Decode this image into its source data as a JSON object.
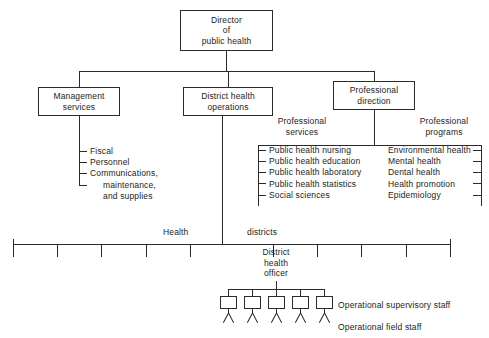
{
  "nodes": {
    "director": {
      "line1": "Director",
      "line2": "of",
      "line3": "public health"
    },
    "management": {
      "line1": "Management",
      "line2": "services"
    },
    "district_ops": {
      "line1": "District health",
      "line2": "operations"
    },
    "prof_direction": {
      "line1": "Professional",
      "line2": "direction"
    }
  },
  "headings": {
    "professional_services": {
      "line1": "Professional",
      "line2": "services"
    },
    "professional_programs": {
      "line1": "Professional",
      "line2": "programs"
    },
    "health": "Health",
    "districts": "districts"
  },
  "management_items": [
    "Fiscal",
    "Personnel",
    "Communications,",
    "maintenance,",
    "and supplies"
  ],
  "professional_services_items": [
    "Public health nursing",
    "Public health education",
    "Public health laboratory",
    "Public health statistics",
    "Social sciences"
  ],
  "professional_programs_items": [
    "Environmental health",
    "Mental health",
    "Dental health",
    "Health promotion",
    "Epidemiology"
  ],
  "district_officer": {
    "line1": "District",
    "line2": "health",
    "line3": "officer"
  },
  "staff_labels": {
    "supervisory": "Operational supervisory staff",
    "field": "Operational field staff"
  },
  "district_tick_count": 10,
  "staff_figure_count": 5,
  "colors": {
    "line": "#2a2a2a",
    "text": "#1d1d1d",
    "background": "#ffffff"
  }
}
